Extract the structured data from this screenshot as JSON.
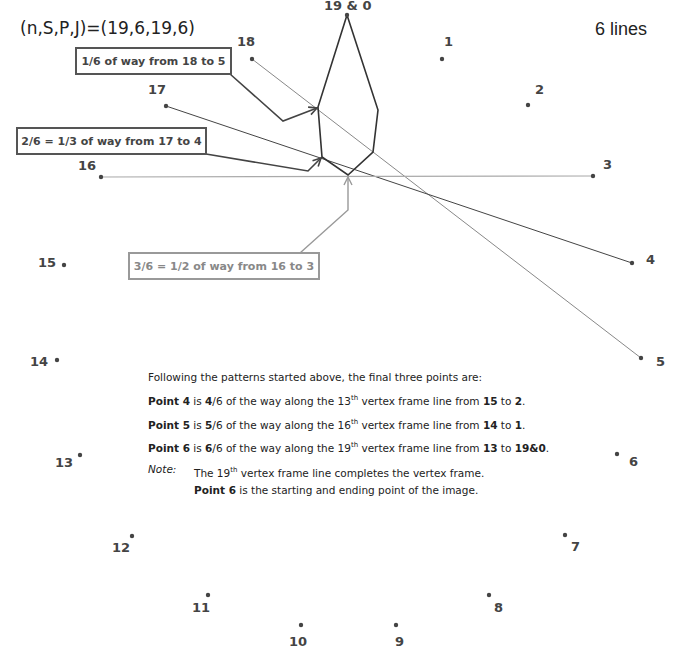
{
  "header": {
    "params": "(n,S,P,J)=(19,6,19,6)",
    "lines_count": "6 lines"
  },
  "frame_points": [
    {
      "label": "19 & 0"
    },
    {
      "label": "1"
    },
    {
      "label": "2"
    },
    {
      "label": "3"
    },
    {
      "label": "4"
    },
    {
      "label": "5"
    },
    {
      "label": "6"
    },
    {
      "label": "7"
    },
    {
      "label": "8"
    },
    {
      "label": "9"
    },
    {
      "label": "10"
    },
    {
      "label": "11"
    },
    {
      "label": "12"
    },
    {
      "label": "13"
    },
    {
      "label": "14"
    },
    {
      "label": "15"
    },
    {
      "label": "16"
    },
    {
      "label": "17"
    },
    {
      "label": "18"
    }
  ],
  "vertex_frame_lines": [
    {
      "from": "18",
      "to": "5"
    },
    {
      "from": "17",
      "to": "4"
    },
    {
      "from": "16",
      "to": "3"
    }
  ],
  "callouts": [
    {
      "text": "1/6 of way from 18 to 5",
      "style": "dark"
    },
    {
      "text": "2/6 = 1/3 of way from 17 to 4",
      "style": "dark"
    },
    {
      "text": "3/6 = 1/2 of way from 16 to 3",
      "style": "light"
    }
  ],
  "explanation": {
    "intro": "Following the patterns started above, the final three points are:",
    "rows": [
      {
        "point": "Point 4",
        "is": " is ",
        "num": "4",
        "frac": "/6 of the way along the ",
        "ord": "13",
        "sup": "th",
        "mid": " vertex frame line from ",
        "a": "15",
        "to": " to ",
        "b": "2",
        "end": "."
      },
      {
        "point": "Point 5",
        "is": " is ",
        "num": "5",
        "frac": "/6 of the way along the ",
        "ord": "16",
        "sup": "th",
        "mid": " vertex frame line from ",
        "a": "14",
        "to": " to ",
        "b": "1",
        "end": "."
      },
      {
        "point": "Point 6",
        "is": " is ",
        "num": "6",
        "frac": "/6 of the way along the ",
        "ord": "19",
        "sup": "th",
        "mid": " vertex frame line from ",
        "a": "13",
        "to": " to ",
        "b": "19&0",
        "end": "."
      }
    ],
    "note_label": "Note:",
    "note_line1_pre": "The 19",
    "note_line1_sup": "th",
    "note_line1_post": " vertex frame line completes the vertex frame.",
    "note_line2_bold": "Point 6",
    "note_line2_rest": " is the starting and ending point of the image."
  },
  "colors": {
    "dark_line": "#333333",
    "light_line": "#999999",
    "dot": "#444444"
  }
}
